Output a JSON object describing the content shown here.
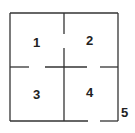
{
  "diagram": {
    "type": "floor-plan",
    "rooms": [
      {
        "label": "1",
        "x": 37,
        "y": 47
      },
      {
        "label": "2",
        "x": 90,
        "y": 45
      },
      {
        "label": "3",
        "x": 37,
        "y": 99
      },
      {
        "label": "4",
        "x": 90,
        "y": 97
      }
    ],
    "outside_label": {
      "label": "5",
      "x": 125,
      "y": 117
    },
    "line_color": "#333333"
  }
}
